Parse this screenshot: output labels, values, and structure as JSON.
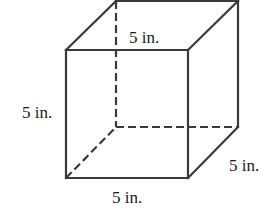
{
  "figure": {
    "type": "cube",
    "units": "in.",
    "edge_length": 5
  },
  "labels": {
    "top": "5 in.",
    "left": "5 in.",
    "bottom": "5 in.",
    "right": "5 in."
  },
  "colors": {
    "line": "#3a3a3a",
    "text": "#1a1a1a",
    "background": "#ffffff"
  }
}
